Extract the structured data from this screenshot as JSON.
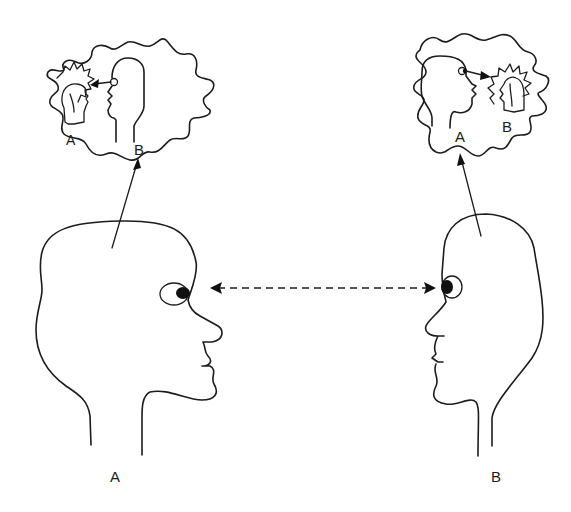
{
  "diagram": {
    "type": "perspective-taking illustration",
    "people": [
      {
        "id": "A",
        "label": "A",
        "facing": "right",
        "position": "left"
      },
      {
        "id": "B",
        "label": "B",
        "facing": "left",
        "position": "right"
      }
    ],
    "thought_bubbles": [
      {
        "owner": "A",
        "style": "wavy cloud",
        "contents": {
          "inner_label_self": "A",
          "inner_label_other": "B",
          "description": "A imagines B looking at a small A"
        }
      },
      {
        "owner": "B",
        "style": "wavy cloud",
        "contents": {
          "inner_label_self": "A",
          "inner_label_other": "B",
          "description": "B imagines A looking at a small B"
        }
      }
    ],
    "gaze_arrow": {
      "style": "dashed",
      "direction": "bidirectional",
      "between": [
        "A",
        "B"
      ]
    },
    "colors": {
      "line": "#1c1c1c",
      "background": "#ffffff"
    }
  }
}
